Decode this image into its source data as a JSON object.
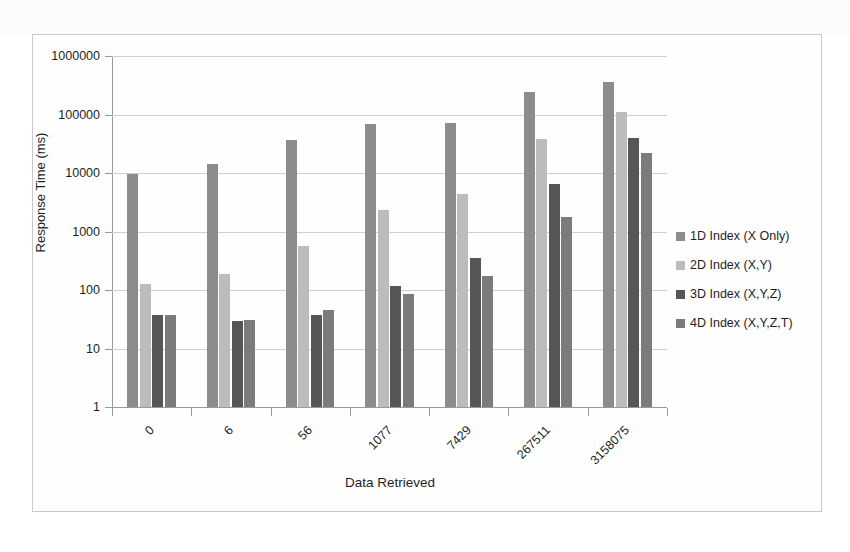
{
  "chart_data": {
    "type": "bar",
    "title": "",
    "xlabel": "Data Retrieved",
    "ylabel": "Response Time (ms)",
    "yscale": "log",
    "ylim": [
      1,
      1000000
    ],
    "ytick_labels": [
      "1000000",
      "100000",
      "10000",
      "1000",
      "100",
      "10",
      "1"
    ],
    "ytick_values": [
      1000000,
      100000,
      10000,
      1000,
      100,
      10,
      1
    ],
    "grid": true,
    "legend_position": "right",
    "categories": [
      "0",
      "6",
      "56",
      "1077",
      "7429",
      "267511",
      "3158075"
    ],
    "series": [
      {
        "name": "1D Index (X Only)",
        "color": "#8c8c8c",
        "values": [
          9800,
          14000,
          36000,
          68000,
          72000,
          240000,
          360000
        ]
      },
      {
        "name": "2D Index (X,Y)",
        "color": "#bcbcbc",
        "values": [
          125,
          190,
          570,
          2300,
          4400,
          38000,
          110000
        ]
      },
      {
        "name": "3D Index (X,Y,Z)",
        "color": "#565656",
        "values": [
          38,
          30,
          38,
          115,
          350,
          6500,
          40000
        ]
      },
      {
        "name": "4D Index (X,Y,Z,T)",
        "color": "#7b7b7b",
        "values": [
          38,
          31,
          45,
          85,
          175,
          1800,
          22000
        ]
      }
    ]
  }
}
